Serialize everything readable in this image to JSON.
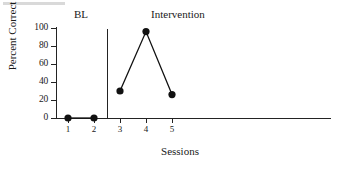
{
  "chart_data": {
    "type": "line",
    "title": "",
    "xlabel": "Sessions",
    "ylabel": "Percent Correct",
    "x": [
      1,
      2,
      3,
      4,
      5
    ],
    "xticklabels": [
      "1",
      "2",
      "3",
      "4",
      "5"
    ],
    "yticks": [
      0,
      20,
      40,
      60,
      80,
      100
    ],
    "yticklabels": [
      "0",
      "20",
      "40",
      "60",
      "80",
      "100"
    ],
    "xlim": [
      0.5,
      9.5
    ],
    "ylim": [
      0,
      100
    ],
    "grid": false,
    "legend": null,
    "marker": "filled-circle",
    "marker_color": "#111111",
    "line_color": "#111111",
    "series": [
      {
        "name": "Percent Correct",
        "phase": "BL",
        "x": [
          1,
          2
        ],
        "values": [
          0,
          0
        ]
      },
      {
        "name": "Percent Correct",
        "phase": "Intervention",
        "x": [
          3,
          4,
          5
        ],
        "values": [
          30,
          96,
          26
        ]
      }
    ],
    "annotations": [
      {
        "label": "BL",
        "phase_start_x": 0.5,
        "phase_end_x": 2.5
      },
      {
        "label": "Intervention",
        "phase_start_x": 2.5,
        "phase_end_x": 5.5
      }
    ],
    "phase_change_line_x": 2.5
  },
  "axes": {
    "y_title": "Percent Correct",
    "x_title": "Sessions",
    "y_ticks": [
      "0",
      "20",
      "40",
      "60",
      "80",
      "100"
    ],
    "x_ticks": [
      "1",
      "2",
      "3",
      "4",
      "5"
    ]
  },
  "phases": {
    "baseline_label": "BL",
    "intervention_label": "Intervention"
  },
  "style": {
    "ink": "#1a1a1a",
    "axis": "#232323",
    "background": "#ffffff"
  }
}
